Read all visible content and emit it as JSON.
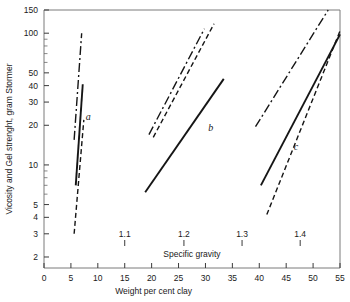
{
  "chart_data": {
    "type": "line",
    "title": "",
    "xlabel": "Weight per cent clay",
    "ylabel": "Vicosity and Gel strenght, gram Stormer",
    "secondary_xlabel": "Specific gravity",
    "xlim": [
      0,
      55
    ],
    "ylim": [
      1.65,
      150
    ],
    "yscale": "log",
    "xscale": "linear",
    "grid": false,
    "legend": null,
    "xticks": [
      0,
      5,
      10,
      15,
      20,
      25,
      30,
      35,
      40,
      45,
      50,
      55
    ],
    "xticklabels": [
      "0",
      "5",
      "10",
      "15",
      "20",
      "25",
      "30",
      "35",
      "40",
      "45",
      "50",
      "55"
    ],
    "yticks": [
      2,
      3,
      4,
      5,
      10,
      20,
      30,
      40,
      50,
      100,
      150
    ],
    "yticklabels": [
      "2",
      "3",
      "4",
      "5",
      "10",
      "20",
      "30",
      "40",
      "50",
      "100",
      "150"
    ],
    "y_minor_ticks": [
      6,
      7,
      8,
      9,
      60,
      70,
      80,
      90
    ],
    "secondary_xticks": [
      {
        "x": 15.0,
        "label": "1.1"
      },
      {
        "x": 26.0,
        "label": "1.2"
      },
      {
        "x": 36.8,
        "label": "1.3"
      },
      {
        "x": 47.6,
        "label": "1.4"
      }
    ],
    "annotations": [
      {
        "text": "a",
        "x": 8.2,
        "y": 22.0
      },
      {
        "text": "b",
        "x": 31.0,
        "y": 18.0
      },
      {
        "text": "c",
        "x": 46.8,
        "y": 13.0
      }
    ],
    "series": [
      {
        "name": "a-dashdot",
        "group": "a",
        "style": "dashdot",
        "points": [
          [
            5.6,
            15.5
          ],
          [
            7.0,
            100.0
          ]
        ]
      },
      {
        "name": "a-solid",
        "group": "a",
        "style": "solid",
        "points": [
          [
            5.9,
            7.0
          ],
          [
            7.2,
            41.0
          ]
        ]
      },
      {
        "name": "a-dashed",
        "group": "a",
        "style": "dashed",
        "points": [
          [
            5.6,
            3.0
          ],
          [
            7.4,
            22.0
          ]
        ]
      },
      {
        "name": "b-dashdot",
        "group": "b",
        "style": "dashdot",
        "points": [
          [
            19.5,
            17.0
          ],
          [
            29.8,
            108.0
          ]
        ]
      },
      {
        "name": "b-dashed",
        "group": "b",
        "style": "dashed",
        "points": [
          [
            20.3,
            16.2
          ],
          [
            31.6,
            118.0
          ]
        ]
      },
      {
        "name": "b-solid",
        "group": "b",
        "style": "solid",
        "points": [
          [
            18.8,
            6.2
          ],
          [
            33.4,
            45.0
          ]
        ]
      },
      {
        "name": "c-dashdot",
        "group": "c",
        "style": "dashdot",
        "points": [
          [
            39.3,
            19.5
          ],
          [
            52.8,
            150.0
          ]
        ]
      },
      {
        "name": "c-solid",
        "group": "c",
        "style": "solid",
        "points": [
          [
            40.3,
            7.0
          ],
          [
            55.0,
            98.0
          ]
        ]
      },
      {
        "name": "c-dashed",
        "group": "c",
        "style": "dashed",
        "points": [
          [
            41.4,
            4.2
          ],
          [
            55.0,
            104.0
          ]
        ]
      }
    ]
  },
  "colors": {
    "frame": "#7a7a7a",
    "line": "#151515",
    "text": "#1a1a1a",
    "background": "#ffffff"
  }
}
